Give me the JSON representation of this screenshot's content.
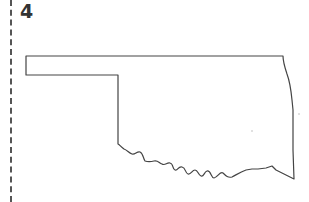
{
  "worksheet": {
    "page_number": "4",
    "cut_line": "dashed-vertical-left"
  },
  "map": {
    "subject": "Oklahoma state outline",
    "labels": [],
    "outline_color": "#444444",
    "background_color": "#ffffff"
  }
}
